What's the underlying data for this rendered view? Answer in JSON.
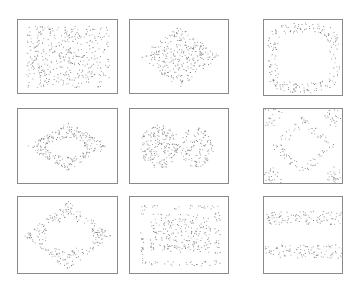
{
  "chart_data": [
    {
      "type": "scatter",
      "panel": 1,
      "row": 1,
      "col": 1,
      "pattern": "uniform random fill",
      "box": [
        17,
        19,
        101,
        75
      ],
      "n_points": 420,
      "color": "#777777"
    },
    {
      "type": "scatter",
      "panel": 2,
      "row": 1,
      "col": 2,
      "pattern": "diamond / rhombus cluster",
      "box": [
        129,
        19,
        100,
        75
      ],
      "n_points": 300,
      "color": "#777777"
    },
    {
      "type": "scatter",
      "panel": 3,
      "row": 1,
      "col": 3,
      "pattern": "ring (hollow center)",
      "box": [
        263,
        19,
        80,
        77
      ],
      "n_points": 220,
      "color": "#777777"
    },
    {
      "type": "scatter",
      "panel": 4,
      "row": 2,
      "col": 1,
      "pattern": "lip-shaped ring (two lobes, hollow center)",
      "box": [
        17,
        108,
        101,
        76
      ],
      "n_points": 260,
      "color": "#777777"
    },
    {
      "type": "scatter",
      "panel": 5,
      "row": 2,
      "col": 2,
      "pattern": "two adjacent filled blobs",
      "box": [
        129,
        108,
        100,
        76
      ],
      "n_points": 320,
      "color": "#777777"
    },
    {
      "type": "scatter",
      "panel": 6,
      "row": 2,
      "col": 3,
      "pattern": "diamond ring plus corner clusters",
      "box": [
        263,
        108,
        80,
        76
      ],
      "n_points": 200,
      "color": "#777777"
    },
    {
      "type": "scatter",
      "panel": 7,
      "row": 3,
      "col": 1,
      "pattern": "hollow hexagon / diamond outline with thick top & bottom",
      "box": [
        17,
        196,
        101,
        78
      ],
      "n_points": 240,
      "color": "#777777"
    },
    {
      "type": "scatter",
      "panel": 8,
      "row": 3,
      "col": 2,
      "pattern": "dense rectangle inside sparse rectangular frame",
      "box": [
        129,
        196,
        100,
        78
      ],
      "n_points": 340,
      "color": "#777777"
    },
    {
      "type": "scatter",
      "panel": 9,
      "row": 3,
      "col": 3,
      "pattern": "two horizontal bands",
      "box": [
        263,
        196,
        80,
        78
      ],
      "n_points": 220,
      "color": "#777777"
    }
  ],
  "figure": {
    "layout": "3x3 grid of scatter panels",
    "axes_visible": false,
    "ticks": false,
    "labels": false
  }
}
